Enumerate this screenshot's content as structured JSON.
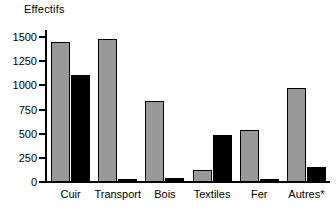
{
  "chart_data": {
    "type": "bar",
    "title": "",
    "ylabel": "Effectifs",
    "xlabel": "",
    "ylim": [
      0,
      1500
    ],
    "yticks": [
      0,
      250,
      500,
      750,
      1000,
      1250,
      1500
    ],
    "ytick_labels": [
      "0",
      "250",
      "500",
      "750",
      "1000",
      "1250",
      "1500"
    ],
    "grid": false,
    "legend": "none",
    "categories": [
      "Cuir",
      "Transport",
      "Bois",
      "Textiles",
      "Fer",
      "Autres*"
    ],
    "series": [
      {
        "name": "series-1",
        "color": "#999999",
        "values": [
          1450,
          1480,
          840,
          120,
          540,
          975
        ]
      },
      {
        "name": "series-2",
        "color": "#000000",
        "values": [
          1105,
          30,
          40,
          490,
          25,
          155
        ]
      }
    ]
  },
  "axis": {
    "y_title": "Effectifs"
  }
}
